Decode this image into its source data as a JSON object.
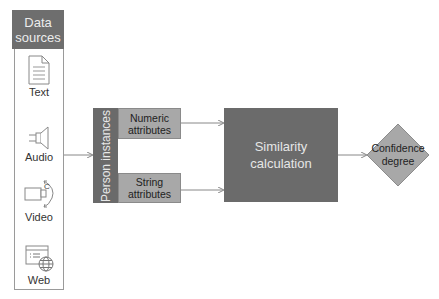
{
  "sidebar": {
    "title_line1": "Data",
    "title_line2": "sources",
    "items": [
      {
        "label": "Text",
        "icon": "document-icon"
      },
      {
        "label": "Audio",
        "icon": "speaker-icon"
      },
      {
        "label": "Video",
        "icon": "video-camera-icon"
      },
      {
        "label": "Web",
        "icon": "web-page-icon"
      }
    ]
  },
  "person": {
    "label": "Person instances"
  },
  "attributes": {
    "numeric": {
      "line1": "Numeric",
      "line2": "attributes"
    },
    "string": {
      "line1": "String",
      "line2": "attributes"
    }
  },
  "similarity": {
    "line1": "Similarity",
    "line2": "calculation"
  },
  "confidence": {
    "line1": "Confidence",
    "line2": "degree"
  },
  "colors": {
    "dark_box": "#6b6b6b",
    "light_box": "#a8a8a8",
    "arrow": "#888888",
    "border": "#9a9a9a"
  }
}
